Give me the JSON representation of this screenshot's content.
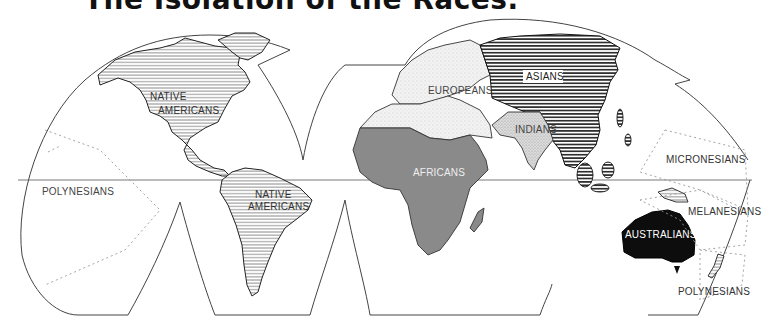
{
  "title": "The Isolation of the Races.",
  "map": {
    "projection": "interrupted world map (Goode-style)",
    "labels": {
      "native_americans_north": [
        "NATIVE",
        "AMERICANS"
      ],
      "native_americans_south": [
        "NATIVE",
        "AMERICANS"
      ],
      "europeans": "EUROPEANS",
      "asians": "ASIANS",
      "indians": "INDIANS",
      "africans": "AFRICANS",
      "micronesians": "MICRONESIANS",
      "melanesians": "MELANESIANS",
      "australians": "AUSTRALIANS",
      "polynesians_east": "POLYNESIANS",
      "polynesians_west": "POLYNESIANS"
    },
    "legend_fills": {
      "native_americans": "horizontal hatch (light)",
      "asians": "horizontal hatch (dark, heavy)",
      "europeans": "stippled light grey",
      "indians": "stippled grey",
      "africans": "solid grey",
      "australians": "solid black",
      "oceania": "dotted boundary zones"
    },
    "colors": {
      "outline": "#333333",
      "africans": "#8a8a8a",
      "australians": "#0d0d0d",
      "europeans": "#ececec",
      "indians": "#d6d6d6",
      "hatch": "#555555",
      "background": "#ffffff"
    }
  }
}
